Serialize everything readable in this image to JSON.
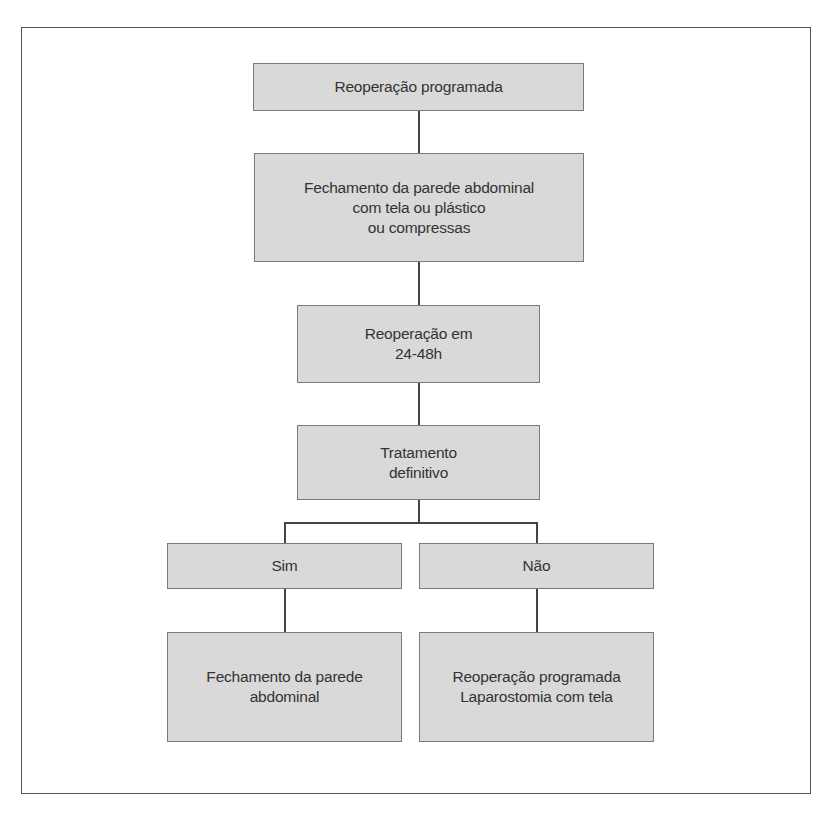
{
  "diagram": {
    "type": "flowchart",
    "nodes": {
      "start": {
        "label": "Reoperação programada"
      },
      "closure_temp": {
        "label": "Fechamento da parede abdominal\ncom tela ou plástico\nou compressas"
      },
      "reop_time": {
        "label": "Reoperação em\n24-48h"
      },
      "definitive": {
        "label": "Tratamento\ndefinitivo"
      },
      "yes": {
        "label": "Sim"
      },
      "no": {
        "label": "Não"
      },
      "yes_result": {
        "label": "Fechamento da parede\nabdominal"
      },
      "no_result": {
        "label": "Reoperação programada\nLaparostomia com tela"
      }
    },
    "edges": [
      {
        "from": "start",
        "to": "closure_temp"
      },
      {
        "from": "closure_temp",
        "to": "reop_time"
      },
      {
        "from": "reop_time",
        "to": "definitive"
      },
      {
        "from": "definitive",
        "to": "yes"
      },
      {
        "from": "definitive",
        "to": "no"
      },
      {
        "from": "yes",
        "to": "yes_result"
      },
      {
        "from": "no",
        "to": "no_result"
      }
    ],
    "colors": {
      "node_fill": "#d9d9d9",
      "node_border": "#7a7a7a",
      "text": "#333333",
      "connector": "#444444",
      "frame": "#555555"
    }
  }
}
